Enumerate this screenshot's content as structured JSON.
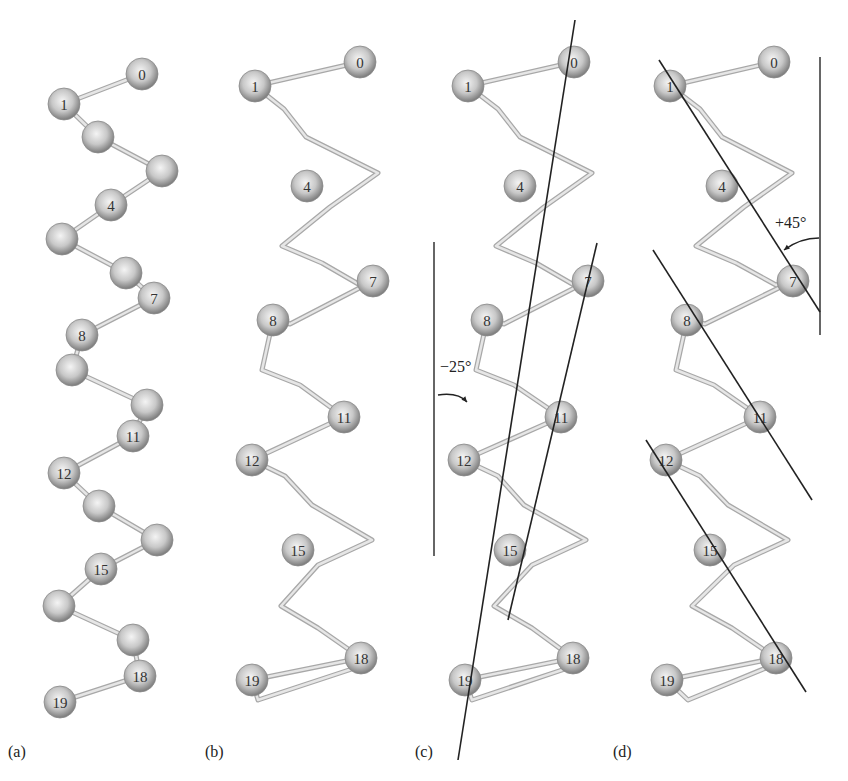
{
  "figure": {
    "atom_radius": 16,
    "colors": {
      "atom_highlight": "#f4f4f4",
      "atom_mid": "#c8c8c8",
      "atom_edge": "#7a7a7a",
      "bond": "#c4c4c4",
      "bond_edge": "#a8a8a8",
      "axis_line": "#222222",
      "reference_line": "#333333"
    },
    "panels": [
      {
        "id": "a",
        "label": "(a)",
        "label_pos": [
          8,
          757
        ],
        "style": "ball-and-stick",
        "atoms": [
          {
            "n": "0",
            "x": 142,
            "y": 74
          },
          {
            "n": "1",
            "x": 64,
            "y": 104
          },
          {
            "n": "",
            "x": 98,
            "y": 137
          },
          {
            "n": "",
            "x": 162,
            "y": 171
          },
          {
            "n": "4",
            "x": 111,
            "y": 205
          },
          {
            "n": "",
            "x": 62,
            "y": 239
          },
          {
            "n": "",
            "x": 126,
            "y": 273
          },
          {
            "n": "7",
            "x": 154,
            "y": 298
          },
          {
            "n": "8",
            "x": 82,
            "y": 335
          },
          {
            "n": "",
            "x": 72,
            "y": 370
          },
          {
            "n": "",
            "x": 147,
            "y": 405
          },
          {
            "n": "11",
            "x": 133,
            "y": 436
          },
          {
            "n": "12",
            "x": 64,
            "y": 473
          },
          {
            "n": "",
            "x": 99,
            "y": 506
          },
          {
            "n": "",
            "x": 157,
            "y": 540
          },
          {
            "n": "15",
            "x": 101,
            "y": 569
          },
          {
            "n": "",
            "x": 59,
            "y": 606
          },
          {
            "n": "",
            "x": 133,
            "y": 640
          },
          {
            "n": "18",
            "x": 140,
            "y": 676
          },
          {
            "n": "19",
            "x": 60,
            "y": 702
          }
        ]
      },
      {
        "id": "b",
        "label": "(b)",
        "label_pos": [
          205,
          757
        ],
        "style": "trace",
        "trace": [
          [
            360,
            62
          ],
          [
            255,
            86
          ],
          [
            284,
            109
          ],
          [
            306,
            137
          ],
          [
            378,
            173
          ],
          [
            330,
            207
          ],
          [
            282,
            246
          ],
          [
            322,
            263
          ],
          [
            360,
            285
          ],
          [
            373,
            281
          ],
          [
            290,
            324
          ],
          [
            273,
            320
          ],
          [
            262,
            370
          ],
          [
            300,
            385
          ],
          [
            344,
            417
          ],
          [
            252,
            460
          ],
          [
            285,
            476
          ],
          [
            312,
            505
          ],
          [
            372,
            540
          ],
          [
            318,
            565
          ],
          [
            281,
            606
          ],
          [
            318,
            628
          ],
          [
            361,
            658
          ],
          [
            252,
            680
          ],
          [
            258,
            700
          ],
          [
            355,
            668
          ]
        ],
        "atoms": [
          {
            "n": "0",
            "x": 360,
            "y": 62
          },
          {
            "n": "1",
            "x": 255,
            "y": 86
          },
          {
            "n": "4",
            "x": 307,
            "y": 186
          },
          {
            "n": "7",
            "x": 373,
            "y": 281
          },
          {
            "n": "8",
            "x": 273,
            "y": 320
          },
          {
            "n": "11",
            "x": 344,
            "y": 417
          },
          {
            "n": "12",
            "x": 252,
            "y": 460
          },
          {
            "n": "15",
            "x": 298,
            "y": 550
          },
          {
            "n": "18",
            "x": 361,
            "y": 658
          },
          {
            "n": "19",
            "x": 252,
            "y": 680
          }
        ]
      },
      {
        "id": "c",
        "label": "(c)",
        "label_pos": [
          415,
          757
        ],
        "style": "trace",
        "trace": [
          [
            574,
            62
          ],
          [
            468,
            86
          ],
          [
            498,
            109
          ],
          [
            520,
            137
          ],
          [
            592,
            173
          ],
          [
            544,
            207
          ],
          [
            496,
            246
          ],
          [
            536,
            263
          ],
          [
            574,
            285
          ],
          [
            588,
            281
          ],
          [
            504,
            324
          ],
          [
            487,
            320
          ],
          [
            476,
            370
          ],
          [
            514,
            385
          ],
          [
            561,
            417
          ],
          [
            464,
            460
          ],
          [
            498,
            476
          ],
          [
            524,
            505
          ],
          [
            586,
            540
          ],
          [
            532,
            565
          ],
          [
            494,
            606
          ],
          [
            532,
            628
          ],
          [
            573,
            658
          ],
          [
            465,
            680
          ],
          [
            472,
            700
          ],
          [
            568,
            668
          ]
        ],
        "atoms": [
          {
            "n": "0",
            "x": 574,
            "y": 62
          },
          {
            "n": "1",
            "x": 468,
            "y": 86
          },
          {
            "n": "4",
            "x": 520,
            "y": 186
          },
          {
            "n": "7",
            "x": 588,
            "y": 281
          },
          {
            "n": "8",
            "x": 487,
            "y": 320
          },
          {
            "n": "11",
            "x": 561,
            "y": 417
          },
          {
            "n": "12",
            "x": 464,
            "y": 460
          },
          {
            "n": "15",
            "x": 510,
            "y": 550
          },
          {
            "n": "18",
            "x": 573,
            "y": 658
          },
          {
            "n": "19",
            "x": 465,
            "y": 680
          }
        ],
        "axis_lines": [
          {
            "x1": 575,
            "y1": 20,
            "x2": 458,
            "y2": 760
          },
          {
            "x1": 597,
            "y1": 243,
            "x2": 508,
            "y2": 620
          }
        ],
        "reference_line": {
          "x1": 434,
          "y1": 242,
          "x2": 434,
          "y2": 556
        },
        "angle": {
          "label": "−25°",
          "label_pos": [
            440,
            372
          ],
          "arc": "M438,395 Q458,392 467,402"
        }
      },
      {
        "id": "d",
        "label": "(d)",
        "label_pos": [
          613,
          757
        ],
        "style": "trace",
        "trace": [
          [
            774,
            62
          ],
          [
            670,
            86
          ],
          [
            700,
            109
          ],
          [
            722,
            137
          ],
          [
            792,
            173
          ],
          [
            744,
            207
          ],
          [
            696,
            246
          ],
          [
            736,
            263
          ],
          [
            776,
            285
          ],
          [
            793,
            281
          ],
          [
            705,
            324
          ],
          [
            687,
            320
          ],
          [
            676,
            370
          ],
          [
            714,
            385
          ],
          [
            760,
            417
          ],
          [
            666,
            460
          ],
          [
            700,
            476
          ],
          [
            728,
            505
          ],
          [
            788,
            540
          ],
          [
            734,
            565
          ],
          [
            692,
            606
          ],
          [
            732,
            628
          ],
          [
            776,
            658
          ],
          [
            667,
            680
          ],
          [
            688,
            700
          ],
          [
            766,
            668
          ]
        ],
        "atoms": [
          {
            "n": "0",
            "x": 774,
            "y": 62
          },
          {
            "n": "1",
            "x": 670,
            "y": 86
          },
          {
            "n": "4",
            "x": 722,
            "y": 186
          },
          {
            "n": "7",
            "x": 793,
            "y": 281
          },
          {
            "n": "8",
            "x": 687,
            "y": 320
          },
          {
            "n": "11",
            "x": 760,
            "y": 417
          },
          {
            "n": "12",
            "x": 666,
            "y": 460
          },
          {
            "n": "15",
            "x": 710,
            "y": 550
          },
          {
            "n": "18",
            "x": 776,
            "y": 658
          },
          {
            "n": "19",
            "x": 667,
            "y": 680
          }
        ],
        "axis_lines": [
          {
            "x1": 659,
            "y1": 60,
            "x2": 820,
            "y2": 312
          },
          {
            "x1": 653,
            "y1": 250,
            "x2": 812,
            "y2": 500
          },
          {
            "x1": 646,
            "y1": 440,
            "x2": 806,
            "y2": 692
          }
        ],
        "reference_line": {
          "x1": 820,
          "y1": 57,
          "x2": 820,
          "y2": 335
        },
        "angle": {
          "label": "+45°",
          "label_pos": [
            775,
            228
          ],
          "arc": "M819,238 Q800,238 784,250"
        }
      }
    ]
  }
}
